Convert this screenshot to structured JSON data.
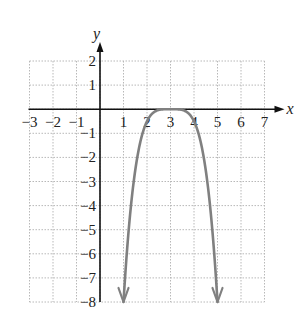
{
  "chart_data": {
    "type": "line",
    "title": "",
    "xlabel": "x",
    "ylabel": "y",
    "xlim": [
      -3,
      7
    ],
    "ylim": [
      -8,
      2
    ],
    "grid": true,
    "x_tick_labels": [
      "-3",
      "-2",
      "-1",
      "1",
      "2",
      "3",
      "4",
      "5",
      "6",
      "7"
    ],
    "y_tick_labels": [
      "2",
      "1",
      "-1",
      "-2",
      "-3",
      "-4",
      "-5",
      "-6",
      "-7",
      "-8"
    ],
    "series": [
      {
        "name": "curve",
        "description": "flat-topped downward curve, maximum 0 at x=3, arrows pointing down at both ends",
        "x": [
          1,
          1.5,
          2,
          2.5,
          3,
          3.5,
          4,
          4.5,
          5
        ],
        "y": [
          -8,
          -2.5,
          -0.5,
          -0.03,
          0,
          -0.03,
          -0.5,
          -2.5,
          -8
        ],
        "color": "#808080",
        "end_arrows": true
      }
    ]
  }
}
